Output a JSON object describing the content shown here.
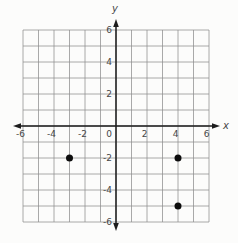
{
  "figure": {
    "background": "#fcfcfb",
    "grid_color": "#8e8e8e",
    "axis_color": "#1c1c1c",
    "label_color": "#474747",
    "point_color": "#0d0d0d"
  },
  "chart_data": {
    "type": "scatter",
    "title": "",
    "xlabel": "x",
    "ylabel": "y",
    "xlim": [
      -6,
      6
    ],
    "ylim": [
      -6,
      6
    ],
    "grid": true,
    "grid_step": 1,
    "x_tick_labels": [
      -6,
      -4,
      -2,
      0,
      2,
      4,
      6
    ],
    "y_tick_labels": [
      6,
      4,
      2,
      -2,
      -4,
      -6
    ],
    "points": [
      {
        "x": -3,
        "y": -2
      },
      {
        "x": 4,
        "y": -2
      },
      {
        "x": 4,
        "y": -5
      }
    ]
  }
}
